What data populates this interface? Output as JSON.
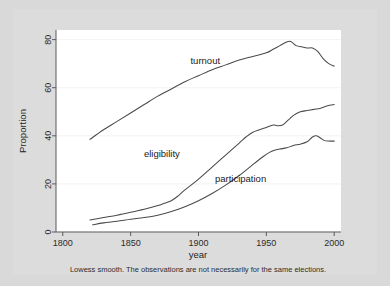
{
  "figure": {
    "background_color": "#d9d9d9",
    "panel_color": "#dcdcdc",
    "plot_background": "#ffffff",
    "line_color": "#4a4a4a",
    "grid_color": "#efefef",
    "caption": "Lowess smooth. The observations are not necessarily for the same elections."
  },
  "chart_data": {
    "type": "line",
    "title": "",
    "subtitle": "",
    "xlabel": "year",
    "ylabel": "Proportion",
    "xlim": [
      1795,
      2005
    ],
    "ylim": [
      0,
      84
    ],
    "xticks": [
      1800,
      1850,
      1900,
      1950,
      2000
    ],
    "xtick_labels": [
      "1800",
      "1850",
      "1900",
      "1950",
      "2000"
    ],
    "yticks": [
      0,
      20,
      40,
      60,
      80
    ],
    "ytick_labels": [
      "0",
      "20",
      "40",
      "60",
      "80"
    ],
    "grid": true,
    "grid_axis": "y",
    "legend_position": "inline-annotations",
    "annotation": "Lowess smooth. The observations are not necessarily for the same elections.",
    "series": [
      {
        "name": "turnout",
        "label": "turnout",
        "label_x": 1905,
        "label_y": 70,
        "x": [
          1820,
          1830,
          1840,
          1850,
          1860,
          1870,
          1880,
          1890,
          1900,
          1910,
          1920,
          1930,
          1940,
          1950,
          1955,
          1960,
          1965,
          1968,
          1972,
          1976,
          1980,
          1984,
          1988,
          1992,
          1996,
          2000
        ],
        "y": [
          38.5,
          42.5,
          46.0,
          49.5,
          53.0,
          56.5,
          59.5,
          62.5,
          65.0,
          67.5,
          69.5,
          71.5,
          73.0,
          74.5,
          76.0,
          77.5,
          79.0,
          79.2,
          77.5,
          77.0,
          76.5,
          76.5,
          75.0,
          72.0,
          70.0,
          69.0
        ]
      },
      {
        "name": "eligibility",
        "label": "eligibility",
        "label_x": 1873,
        "label_y": 31,
        "x": [
          1820,
          1830,
          1840,
          1850,
          1860,
          1870,
          1875,
          1880,
          1885,
          1890,
          1900,
          1910,
          1920,
          1930,
          1935,
          1940,
          1945,
          1950,
          1955,
          1958,
          1962,
          1966,
          1970,
          1975,
          1980,
          1985,
          1990,
          1995,
          2000
        ],
        "y": [
          5.0,
          6.0,
          7.0,
          8.2,
          9.5,
          11.0,
          12.0,
          13.0,
          15.0,
          17.5,
          22.0,
          27.0,
          32.0,
          37.0,
          39.5,
          41.5,
          42.5,
          43.5,
          44.5,
          44.2,
          44.5,
          46.5,
          48.5,
          50.0,
          50.5,
          51.0,
          51.5,
          52.5,
          53.0
        ]
      },
      {
        "name": "participation",
        "label": "participation",
        "label_x": 1931,
        "label_y": 21,
        "x": [
          1822,
          1830,
          1840,
          1850,
          1860,
          1870,
          1880,
          1890,
          1900,
          1910,
          1920,
          1930,
          1940,
          1948,
          1952,
          1956,
          1960,
          1965,
          1970,
          1975,
          1980,
          1984,
          1987,
          1990,
          1993,
          1996,
          2000
        ],
        "y": [
          3.0,
          3.8,
          4.5,
          5.3,
          6.0,
          7.0,
          8.5,
          10.5,
          13.0,
          16.0,
          19.5,
          23.5,
          28.0,
          31.5,
          33.0,
          34.0,
          34.5,
          35.0,
          36.0,
          36.5,
          37.5,
          39.5,
          40.0,
          39.0,
          38.0,
          37.8,
          37.8
        ]
      }
    ]
  }
}
